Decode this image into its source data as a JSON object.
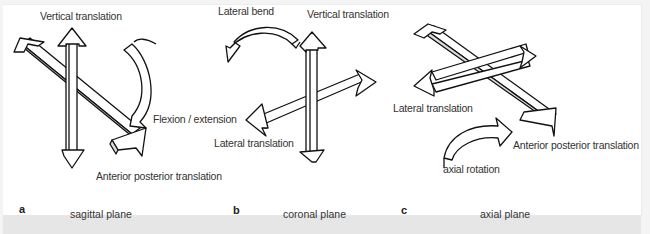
{
  "figure": {
    "panels": [
      {
        "letter": "a",
        "plane": "sagittal plane",
        "labels": {
          "vertical": "Vertical translation",
          "rotation": "Flexion / extension",
          "ap": "Anterior posterior translation"
        }
      },
      {
        "letter": "b",
        "plane": "coronal plane",
        "labels": {
          "rotation": "Lateral bend",
          "vertical": "Vertical translation",
          "lateral": "Lateral translation"
        }
      },
      {
        "letter": "c",
        "plane": "axial plane",
        "labels": {
          "lateral": "Lateral translation",
          "ap": "Anterior posterior translation",
          "rotation": "axial rotation"
        }
      }
    ],
    "colors": {
      "stroke": "#111111",
      "background": "#ffffff",
      "page": "#f4f4f4",
      "caption_strip": "#e6e6e6",
      "text": "#333333"
    }
  }
}
